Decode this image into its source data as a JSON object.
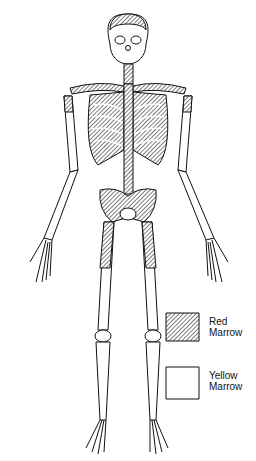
{
  "diagram": {
    "colors": {
      "outline": "#111111",
      "red_marrow_hatch": "#555555",
      "yellow_marrow_fill": "#ffffff",
      "background": "#ffffff"
    }
  },
  "legend": {
    "items": [
      {
        "label_line1": "Red",
        "label_line2": "Marrow",
        "pattern": "hatched"
      },
      {
        "label_line1": "Yellow",
        "label_line2": "Marrow",
        "pattern": "plain"
      }
    ]
  }
}
